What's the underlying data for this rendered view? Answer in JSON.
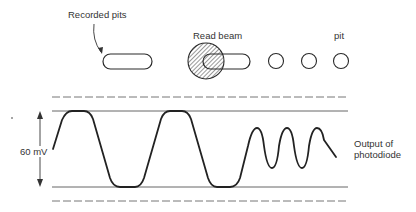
{
  "labels": {
    "recorded_pits": "Recorded pits",
    "read_beam": "Read beam",
    "pit": "pit",
    "voltage": "60 mV",
    "output_line1": "Output of",
    "output_line2": "photodiode"
  },
  "colors": {
    "stroke": "#2a2a2a",
    "ref_line": "#555555",
    "background": "#ffffff"
  }
}
